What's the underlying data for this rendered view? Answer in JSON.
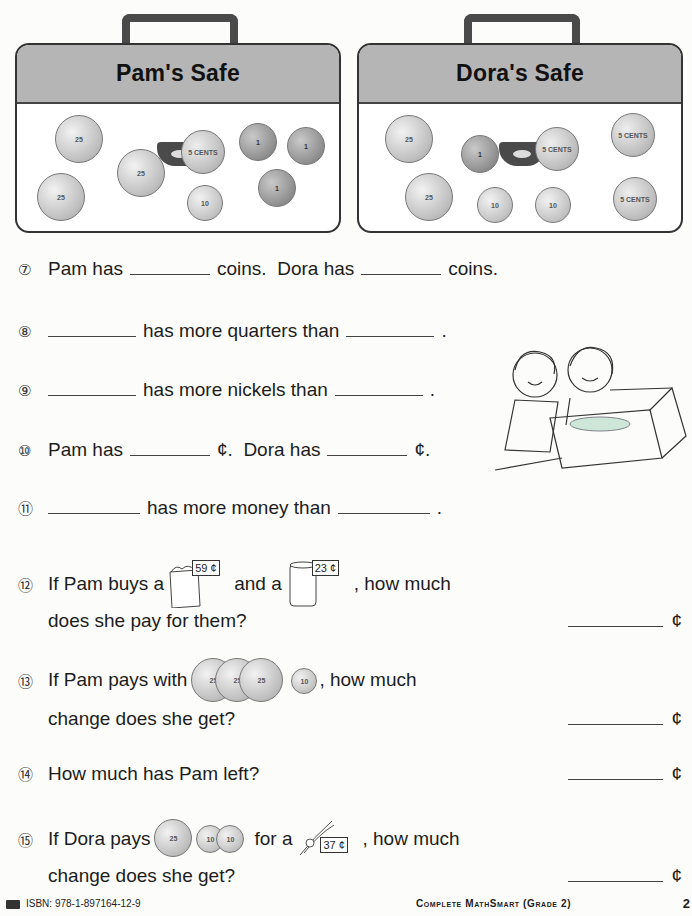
{
  "safes": [
    {
      "title": "Pam's Safe",
      "coins": [
        {
          "type": "quarter",
          "label": "25"
        },
        {
          "type": "quarter",
          "label": "25"
        },
        {
          "type": "quarter",
          "label": "25"
        },
        {
          "type": "nickel",
          "label": "5 CENTS"
        },
        {
          "type": "dime",
          "label": "10"
        },
        {
          "type": "penny",
          "label": "1"
        },
        {
          "type": "penny",
          "label": "1"
        },
        {
          "type": "penny",
          "label": "1"
        }
      ]
    },
    {
      "title": "Dora's Safe",
      "coins": [
        {
          "type": "quarter",
          "label": "25"
        },
        {
          "type": "quarter",
          "label": "25"
        },
        {
          "type": "penny",
          "label": "1"
        },
        {
          "type": "nickel",
          "label": "5 CENTS"
        },
        {
          "type": "nickel",
          "label": "5 CENTS"
        },
        {
          "type": "nickel",
          "label": "5 CENTS"
        },
        {
          "type": "dime",
          "label": "10"
        },
        {
          "type": "dime",
          "label": "10"
        }
      ]
    }
  ],
  "questions": {
    "q7": {
      "num": "⑦",
      "a": "Pam has",
      "b": "coins.  Dora has",
      "c": "coins."
    },
    "q8": {
      "num": "⑧",
      "a": "has more quarters than",
      "b": "."
    },
    "q9": {
      "num": "⑨",
      "a": "has more nickels than",
      "b": "."
    },
    "q10": {
      "num": "⑩",
      "a": "Pam has",
      "b": "¢.  Dora has",
      "c": "¢."
    },
    "q11": {
      "num": "⑪",
      "a": "has more money than",
      "b": "."
    },
    "q12": {
      "num": "⑫",
      "a": "If Pam buys a",
      "item1_label": "Pop corn",
      "item1_price": "59 ¢",
      "b": "and a",
      "item2_label": "Coke",
      "item2_price": "23 ¢",
      "c": ", how much",
      "line2": "does she pay for them?",
      "unit": "¢"
    },
    "q13": {
      "num": "⑬",
      "a": "If Pam pays with",
      "coins": [
        "25",
        "25",
        "25",
        "10"
      ],
      "b": ", how much",
      "line2": "change does she get?",
      "unit": "¢"
    },
    "q14": {
      "num": "⑭",
      "a": "How much has Pam left?",
      "unit": "¢"
    },
    "q15": {
      "num": "⑮",
      "a": "If Dora pays",
      "coins": [
        "25",
        "10",
        "10"
      ],
      "b": "for a",
      "item_price": "37 ¢",
      "c": ", how much",
      "line2": "change does she get?",
      "unit": "¢"
    }
  },
  "footer": {
    "isbn": "ISBN: 978-1-897164-12-9",
    "book": "Complete MathSmart (Grade 2)",
    "page": "2"
  }
}
